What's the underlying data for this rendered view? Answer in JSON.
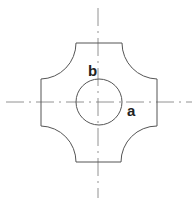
{
  "diagram": {
    "title": "",
    "labels": {
      "a": "a",
      "b": "b"
    },
    "shape": {
      "description": "cross-shaped cutout with concave quarter-circle corners",
      "stroke": "#555555"
    },
    "inner_circle": {
      "cx": 99,
      "cy": 102,
      "r": 23,
      "stroke": "#555555"
    },
    "axes": {
      "style": "dash-dot centerline",
      "stroke": "#777777"
    }
  }
}
